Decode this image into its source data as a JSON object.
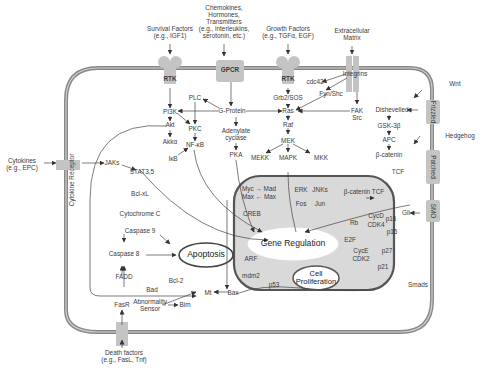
{
  "colors": {
    "membrane": "#8a8a8a",
    "nucleus_fill": "#d9d9d9",
    "nucleus_border": "#555555",
    "receptor": "#c8c8c8",
    "text": "#3a3a3a"
  },
  "external": {
    "survival": "Survival Factors\n(e.g., IGF1)",
    "chemokines": "Chemokines,\nHormones,\nTransmitters\n(e.g., interleukins,\nserotonin, etc.)",
    "growth": "Growth Factors\n(e.g., TGFα, EGF)",
    "ecm": "Extracellular\nMatrix",
    "wnt": "Wnt",
    "hedgehog": "Hedgehog",
    "cytokines": "Cytokines\n(e.g., EPC)",
    "death": "Death factors\n(e.g., FasL, Tnf)"
  },
  "receptors": {
    "rtk1": "RTK",
    "gpcr": "GPCR",
    "rtk2": "RTK",
    "integrins": "Integrins",
    "frizzled": "Frizzled",
    "patched": "Patched",
    "smo": "SMO",
    "cytokine_receptor": "Cytokine Receptor",
    "fasr": "FasR"
  },
  "nodes": {
    "pi3k": "PI3K",
    "akt": "Akt",
    "akka": "Akkα",
    "plc": "PLC",
    "pkc": "PKC",
    "nfkb": "NF-κB",
    "ikb": "IκB",
    "gprotein": "G-Protein",
    "adenylate": "Adenylate\ncyclase",
    "pka": "PKA",
    "cdc42": "cdc42",
    "grb2": "Grb2/SOS",
    "fyn": "Fyn/Shc",
    "ras": "Ras",
    "fak": "FAK\nSrc",
    "raf": "Raf",
    "mek": "MEK",
    "mekk": "MEKK",
    "mapk": "MAPK",
    "mkk": "MKK",
    "dishevelled": "Dishevelled",
    "gsk": "GSK-3β",
    "apc": "APC",
    "bcatenin": "β-catenin",
    "tcf": "TCF",
    "jaks": "JAKs",
    "stat": "STAT3,5",
    "bclxl": "Bcl-xL",
    "cytc": "Cytochrome C",
    "casp9": "Caspase 9",
    "casp8": "Caspase 8",
    "fadd": "FADD",
    "bcl2": "Bcl-2",
    "bad": "Bad",
    "mt": "Mt",
    "bax": "Bax",
    "abnormality": "Abnormality\nSensor",
    "bim": "Bim",
    "mycmad": "Myc → Mad",
    "maxmax": "Max ← Max",
    "erk": "ERK",
    "fos": "Fos",
    "jnks": "JNKs",
    "jun": "Jun",
    "bcattcf": "β-catenin TCF",
    "creb": "CREB",
    "cycd": "CycD",
    "cdk4": "CDK4",
    "rb": "Rb",
    "p16": "p16",
    "p15": "p15",
    "e2f": "E2F",
    "cyce": "CycE",
    "cdk2": "CDK2",
    "p27": "p27",
    "p21": "p21",
    "arf": "ARF",
    "mdm2": "mdm2",
    "p53": "p53",
    "gli": "Gli",
    "smads": "Smads"
  },
  "outcomes": {
    "apoptosis": "Apoptosis",
    "gene_regulation": "Gene Regulation",
    "proliferation": "Cell\nProliferation"
  }
}
